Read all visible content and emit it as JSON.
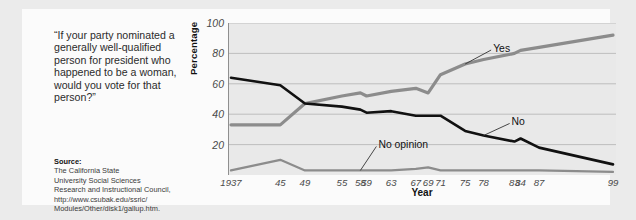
{
  "quote": "“If your party nominated a generally well-qualified person for president who happened to be a woman, would you vote for that person?”",
  "source": {
    "label": "Source:",
    "lines": [
      "The California State",
      "University Social Sciences",
      "Research and Instructional Council,",
      "http://www.csubak.edu/ssric/",
      "Modules/Other/disk1/gallup.htm."
    ]
  },
  "chart_data": {
    "type": "line",
    "title": "",
    "xlabel": "Year",
    "ylabel": "Percentage",
    "categories": [
      "1937",
      "45",
      "49",
      "55",
      "58",
      "59",
      "63",
      "67",
      "69",
      "71",
      "75",
      "78",
      "83",
      "84",
      "87",
      "99"
    ],
    "xticklabels": [
      "1937",
      "45",
      "49",
      "55",
      "58",
      "59",
      "63",
      "67",
      "69",
      "71",
      "75",
      "78",
      "83",
      "84",
      "87",
      "99"
    ],
    "yticklabels": [
      "20",
      "40",
      "60",
      "80",
      "100"
    ],
    "yticks": [
      20,
      40,
      60,
      80,
      100
    ],
    "ylim": [
      0,
      100
    ],
    "grid": true,
    "legend_position": "inline-annotations",
    "series": [
      {
        "name": "Yes",
        "color": "#8c8c8c",
        "values": [
          33,
          33,
          47,
          52,
          54,
          52,
          55,
          57,
          54,
          66,
          73,
          76,
          80,
          82,
          84,
          92
        ]
      },
      {
        "name": "No",
        "color": "#111111",
        "values": [
          64,
          59,
          47,
          45,
          43,
          41,
          42,
          39,
          39,
          39,
          29,
          26,
          22,
          24,
          18,
          7
        ]
      },
      {
        "name": "No opinion",
        "color": "#8c8c8c",
        "values": [
          3,
          10,
          3,
          3,
          3,
          3,
          3,
          4,
          5,
          3,
          3,
          3,
          3,
          3,
          3,
          2
        ]
      }
    ],
    "annotations": [
      {
        "text": "Yes",
        "series": "Yes"
      },
      {
        "text": "No",
        "series": "No"
      },
      {
        "text": "No opinion",
        "series": "No opinion"
      }
    ]
  }
}
